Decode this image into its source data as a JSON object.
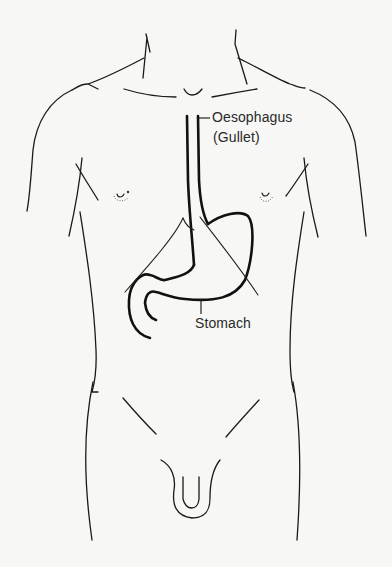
{
  "diagram": {
    "labels": {
      "oesophagus": "Oesophagus",
      "gullet": "(Gullet)",
      "stomach": "Stomach"
    },
    "colors": {
      "background": "#f7f7f5",
      "line": "#1a1a1a"
    }
  }
}
